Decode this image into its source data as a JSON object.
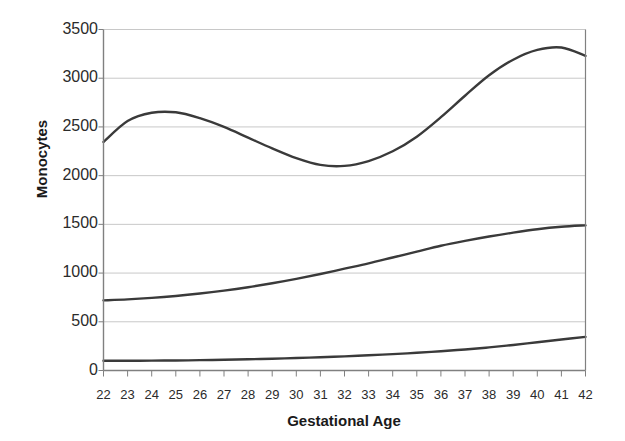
{
  "chart_data": {
    "type": "line",
    "title": "",
    "subtitle": "",
    "xlabel": "Gestational Age",
    "ylabel": "Monocytes",
    "xlim": [
      22,
      42
    ],
    "ylim": [
      0,
      3500
    ],
    "grid": true,
    "legend": "none",
    "xtick_labels": [
      "22",
      "23",
      "24",
      "25",
      "26",
      "27",
      "28",
      "29",
      "30",
      "31",
      "32",
      "33",
      "34",
      "35",
      "36",
      "37",
      "38",
      "39",
      "40",
      "41",
      "42"
    ],
    "ytick_labels": [
      "0",
      "500",
      "1000",
      "1500",
      "2000",
      "2500",
      "3000",
      "3500"
    ],
    "ytick_values": [
      0,
      500,
      1000,
      1500,
      2000,
      2500,
      3000,
      3500
    ],
    "x": [
      22,
      23,
      24,
      25,
      26,
      27,
      28,
      29,
      30,
      31,
      32,
      33,
      34,
      35,
      36,
      37,
      38,
      39,
      40,
      41,
      42
    ],
    "series": [
      {
        "name": "upper-curve",
        "color": "#3a3a3a",
        "values": [
          2345,
          2560,
          2645,
          2650,
          2590,
          2500,
          2390,
          2280,
          2180,
          2110,
          2100,
          2150,
          2250,
          2400,
          2600,
          2820,
          3030,
          3190,
          3290,
          3315,
          3230
        ]
      },
      {
        "name": "middle-curve",
        "color": "#3a3a3a",
        "values": [
          720,
          730,
          745,
          765,
          790,
          820,
          855,
          895,
          940,
          990,
          1045,
          1100,
          1160,
          1220,
          1280,
          1330,
          1375,
          1415,
          1450,
          1475,
          1490
        ]
      },
      {
        "name": "lower-curve",
        "color": "#3a3a3a",
        "values": [
          100,
          100,
          101,
          103,
          106,
          110,
          115,
          121,
          128,
          136,
          145,
          156,
          168,
          182,
          198,
          216,
          237,
          262,
          290,
          318,
          345
        ]
      }
    ]
  },
  "style": {
    "axis_color": "#808080",
    "grid_color": "#c8c8c8",
    "line_color": "#3a3a3a",
    "text_color": "#2b2b2b",
    "background": "#ffffff"
  }
}
